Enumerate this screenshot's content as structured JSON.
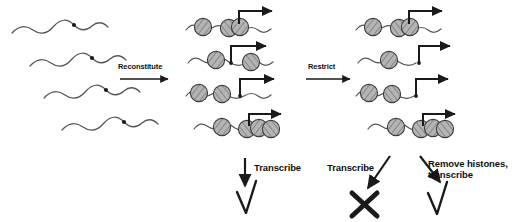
{
  "figure": {
    "background_color": "#ffffff",
    "ink_color": "#1a1a1a",
    "nucleosome_fill": "#b0b0b0",
    "nucleosome_stroke": "#3a3a3a",
    "dna_color": "#555555"
  },
  "steps": [
    {
      "id": "reconstitute",
      "label": "Reconstitute"
    },
    {
      "id": "restrict",
      "label": "Restrict"
    }
  ],
  "outcomes": [
    {
      "id": "outcome-middle-transcribe",
      "label": "Transcribe",
      "result_symbol": "check",
      "result_meaning": "transcription occurs"
    },
    {
      "id": "outcome-right-transcribe",
      "label": "Transcribe",
      "result_symbol": "cross",
      "result_meaning": "transcription blocked"
    },
    {
      "id": "outcome-right-remove-histones",
      "label": "Remove histones, transcribe",
      "label_line1": "Remove histones,",
      "label_line2": "transcribe",
      "result_symbol": "check",
      "result_meaning": "transcription occurs"
    }
  ],
  "columns": [
    {
      "id": "column-naked-dna",
      "name": "naked DNA templates",
      "rows": [
        {
          "id": "dna-row-1",
          "nucleosome_count": 0,
          "has_site_marker": true
        },
        {
          "id": "dna-row-2",
          "nucleosome_count": 0,
          "has_site_marker": true
        },
        {
          "id": "dna-row-3",
          "nucleosome_count": 0,
          "has_site_marker": true
        },
        {
          "id": "dna-row-4",
          "nucleosome_count": 0,
          "has_site_marker": true
        }
      ]
    },
    {
      "id": "column-reconstituted",
      "name": "reconstituted chromatin templates",
      "rows": [
        {
          "id": "chromatin-row-1",
          "nucleosome_count": 3,
          "promoter_arrow": true,
          "promoter_clear": true
        },
        {
          "id": "chromatin-row-2",
          "nucleosome_count": 2,
          "promoter_arrow": true,
          "promoter_clear": true
        },
        {
          "id": "chromatin-row-3",
          "nucleosome_count": 2,
          "promoter_arrow": true,
          "promoter_clear": true
        },
        {
          "id": "chromatin-row-4",
          "nucleosome_count": 4,
          "promoter_arrow": true,
          "promoter_clear": false
        }
      ]
    },
    {
      "id": "column-restricted",
      "name": "restriction-digested chromatin templates",
      "rows": [
        {
          "id": "restricted-row-1",
          "nucleosome_count": 3,
          "promoter_arrow": true,
          "promoter_clear": true
        },
        {
          "id": "restricted-row-2",
          "nucleosome_count": 1,
          "promoter_arrow": true,
          "promoter_clear": true
        },
        {
          "id": "restricted-row-3",
          "nucleosome_count": 2,
          "promoter_arrow": true,
          "promoter_clear": true
        },
        {
          "id": "restricted-row-4",
          "nucleosome_count": 4,
          "promoter_arrow": true,
          "promoter_clear": false
        }
      ]
    }
  ]
}
